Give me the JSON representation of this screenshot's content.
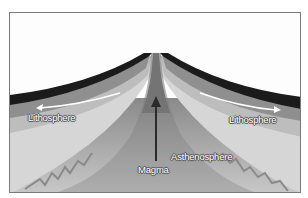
{
  "diagram": {
    "type": "mid-ocean ridge cross-section",
    "labels": {
      "lithosphere_left": "Lithosphere",
      "lithosphere_right": "Lithosphere",
      "asthenosphere": "Asthenosphere",
      "magma": "Magma"
    },
    "colors": {
      "ocean_crust": "#1c1c1c",
      "lithosphere_upper": "#8e8e8e",
      "lithosphere_lower": "#c4c4c4",
      "pale_band": "#dadada",
      "asthenosphere": "#a8a8a8",
      "magma_channel": "#777777",
      "arrow": "#2a2a2a",
      "background": "#fdfdfd"
    }
  }
}
